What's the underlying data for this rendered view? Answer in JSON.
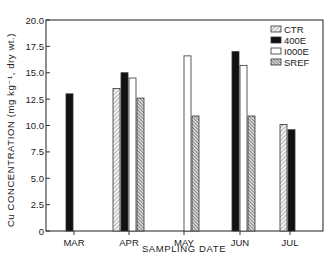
{
  "chart_data": {
    "type": "bar",
    "title": "",
    "xlabel": "SAMPLING DATE",
    "ylabel": "Cu CONCENTRATION (mg kg⁻¹, dry wt.)",
    "ylim": [
      0,
      20
    ],
    "yticks": [
      "0",
      "2.5",
      "5.0",
      "7.5",
      "10.0",
      "12.5",
      "15.0",
      "17.5",
      "20.0"
    ],
    "ytick_values": [
      0,
      2.5,
      5,
      7.5,
      10,
      12.5,
      15,
      17.5,
      20
    ],
    "categories": [
      "MAR",
      "APR",
      "MAY",
      "JUN",
      "JUL"
    ],
    "grid": false,
    "legend_position": "upper right",
    "series": [
      {
        "name": "CTR",
        "pattern": "light-hatch",
        "values": [
          null,
          13.5,
          null,
          null,
          10.1
        ]
      },
      {
        "name": "400E",
        "pattern": "solid-black",
        "values": [
          13.0,
          15.0,
          null,
          17.0,
          9.6
        ]
      },
      {
        "name": "1000E",
        "pattern": "white",
        "values": [
          null,
          14.5,
          16.6,
          15.7,
          null
        ]
      },
      {
        "name": "SREF",
        "pattern": "dense-hatch",
        "values": [
          null,
          12.6,
          10.9,
          10.9,
          null
        ]
      }
    ]
  },
  "legend": {
    "items": [
      {
        "label": "CTR"
      },
      {
        "label": "400E"
      },
      {
        "label": "I000E"
      },
      {
        "label": "SREF"
      }
    ]
  }
}
